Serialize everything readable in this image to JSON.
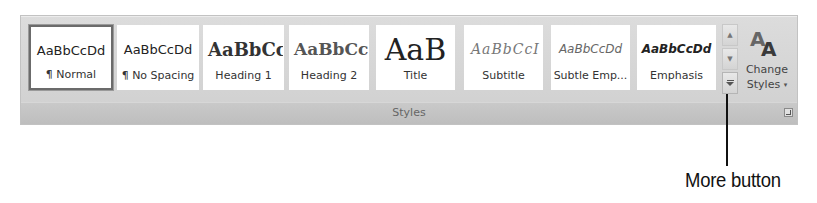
{
  "ribbon_group": {
    "name": "Styles",
    "quick_styles": [
      {
        "sample": "AaBbCcDd",
        "label": "¶ Normal",
        "selected": true
      },
      {
        "sample": "AaBbCcDd",
        "label": "¶ No Spacing",
        "selected": false
      },
      {
        "sample": "AaBbCc",
        "label": "Heading 1",
        "selected": false
      },
      {
        "sample": "AaBbCc",
        "label": "Heading 2",
        "selected": false
      },
      {
        "sample": "AaB",
        "label": "Title",
        "selected": false
      },
      {
        "sample": "AaBbCcI",
        "label": "Subtitle",
        "selected": false
      },
      {
        "sample": "AaBbCcDd",
        "label": "Subtle Emp...",
        "selected": false
      },
      {
        "sample": "AaBbCcDd",
        "label": "Emphasis",
        "selected": false
      }
    ],
    "scroll": {
      "up_icon": "scroll-up-icon",
      "down_icon": "scroll-down-icon",
      "more_icon": "more-icon"
    },
    "change_styles": {
      "line1": "Change",
      "line2": "Styles",
      "caret": "▾",
      "icon": "change-styles-icon"
    },
    "dialog_launcher_icon": "dialog-launcher-icon"
  },
  "callout": {
    "text": "More button",
    "color": "#111111"
  },
  "colors": {
    "panel_bg": "#d6d6d6",
    "label_bar": "#c4c4c4",
    "selected_border": "#6b6b6b"
  }
}
